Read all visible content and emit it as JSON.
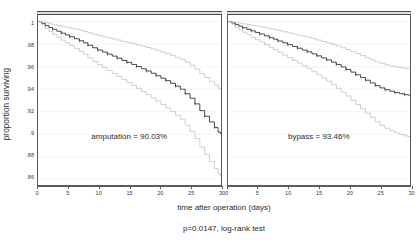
{
  "chart_data": {
    "type": "line",
    "title": "",
    "subtitle": "",
    "xlabel": "time after operation (days)",
    "ylabel": "proportion surviving",
    "footnote": "p=0.0147, log-rank test",
    "xlim": [
      0,
      30
    ],
    "ylim": [
      0.855,
      1.005
    ],
    "xticks": [
      0,
      5,
      10,
      15,
      20,
      25,
      30
    ],
    "xticklabels": [
      "0",
      "5",
      "10",
      "15",
      "20",
      "25",
      "30"
    ],
    "yticks": [
      1,
      0.98,
      0.96,
      0.94,
      0.92,
      0.9,
      0.88,
      0.86
    ],
    "yticklabels": [
      "1",
      ".98",
      ".96",
      ".94",
      ".92",
      ".9",
      ".88",
      ".86"
    ],
    "grid": true,
    "grid_axis": "y",
    "legend": "none",
    "step_style": "post",
    "panels": [
      {
        "name": "amputation",
        "annotation": "amputation = 90.03%",
        "final_survival_percent": 90.03,
        "series": [
          {
            "name": "Kaplan-Meier estimate",
            "role": "estimate",
            "color": "#2a2a2a",
            "x": [
              0,
              0.6,
              1.2,
              1.8,
              2.4,
              3.1,
              3.8,
              4.5,
              5.2,
              6.0,
              6.8,
              7.5,
              8.2,
              9.0,
              9.8,
              10.6,
              11.4,
              12.2,
              13.0,
              13.8,
              14.6,
              15.4,
              16.2,
              17.0,
              17.8,
              18.6,
              19.4,
              20.2,
              21.0,
              21.8,
              22.6,
              23.4,
              24.2,
              25.0,
              25.8,
              26.6,
              27.4,
              28.2,
              29.0,
              29.6,
              30
            ],
            "y": [
              1.0,
              0.9985,
              0.9965,
              0.9948,
              0.9932,
              0.9915,
              0.9898,
              0.9882,
              0.9866,
              0.9848,
              0.983,
              0.9812,
              0.979,
              0.9768,
              0.9748,
              0.973,
              0.9712,
              0.9694,
              0.9676,
              0.9656,
              0.9638,
              0.962,
              0.9602,
              0.9582,
              0.9562,
              0.9542,
              0.952,
              0.9498,
              0.9476,
              0.9452,
              0.9428,
              0.94,
              0.936,
              0.932,
              0.927,
              0.921,
              0.916,
              0.911,
              0.906,
              0.902,
              0.9003
            ]
          },
          {
            "name": "95% CI upper",
            "role": "ci_upper",
            "color": "#b6b6b6",
            "x": [
              0,
              0.6,
              1.2,
              1.8,
              2.4,
              3.1,
              3.8,
              4.5,
              5.2,
              6.0,
              6.8,
              7.5,
              8.2,
              9.0,
              9.8,
              10.6,
              11.4,
              12.2,
              13.0,
              13.8,
              14.6,
              15.4,
              16.2,
              17.0,
              17.8,
              18.6,
              19.4,
              20.2,
              21.0,
              21.8,
              22.6,
              23.4,
              24.2,
              25.0,
              25.8,
              26.6,
              27.4,
              28.2,
              29.0,
              29.6,
              30
            ],
            "y": [
              1.0,
              0.9996,
              0.999,
              0.9982,
              0.9974,
              0.9966,
              0.9958,
              0.995,
              0.9942,
              0.9932,
              0.9922,
              0.9912,
              0.99,
              0.9888,
              0.9876,
              0.9866,
              0.9856,
              0.9846,
              0.9836,
              0.9824,
              0.9814,
              0.9804,
              0.9794,
              0.9782,
              0.977,
              0.9758,
              0.9744,
              0.973,
              0.9716,
              0.97,
              0.9684,
              0.9666,
              0.964,
              0.9612,
              0.9578,
              0.9538,
              0.9504,
              0.947,
              0.9436,
              0.9408,
              0.9396
            ]
          },
          {
            "name": "95% CI lower",
            "role": "ci_lower",
            "color": "#b6b6b6",
            "x": [
              0,
              0.6,
              1.2,
              1.8,
              2.4,
              3.1,
              3.8,
              4.5,
              5.2,
              6.0,
              6.8,
              7.5,
              8.2,
              9.0,
              9.8,
              10.6,
              11.4,
              12.2,
              13.0,
              13.8,
              14.6,
              15.4,
              16.2,
              17.0,
              17.8,
              18.6,
              19.4,
              20.2,
              21.0,
              21.8,
              22.6,
              23.4,
              24.2,
              25.0,
              25.8,
              26.6,
              27.4,
              28.2,
              29.0,
              29.6,
              30
            ],
            "y": [
              1.0,
              0.997,
              0.9938,
              0.9912,
              0.9888,
              0.9862,
              0.9836,
              0.9812,
              0.9788,
              0.9762,
              0.9736,
              0.971,
              0.9678,
              0.9646,
              0.9618,
              0.9592,
              0.9566,
              0.954,
              0.9514,
              0.9486,
              0.946,
              0.9434,
              0.9408,
              0.938,
              0.9352,
              0.9324,
              0.9294,
              0.9264,
              0.9234,
              0.9202,
              0.917,
              0.9134,
              0.908,
              0.9026,
              0.8962,
              0.8886,
              0.8822,
              0.8758,
              0.8696,
              0.8648,
              0.8626
            ]
          }
        ]
      },
      {
        "name": "bypass",
        "annotation": "bypass = 93.46%",
        "final_survival_percent": 93.46,
        "series": [
          {
            "name": "Kaplan-Meier estimate",
            "role": "estimate",
            "color": "#2a2a2a",
            "x": [
              0,
              0.6,
              1.2,
              1.8,
              2.4,
              3.1,
              3.8,
              4.5,
              5.2,
              6.0,
              6.8,
              7.5,
              8.2,
              9.0,
              9.8,
              10.6,
              11.4,
              12.2,
              13.0,
              13.8,
              14.6,
              15.4,
              16.2,
              17.0,
              17.8,
              18.6,
              19.4,
              20.2,
              21.0,
              21.8,
              22.6,
              23.4,
              24.2,
              25.0,
              25.8,
              26.6,
              27.4,
              28.2,
              29.0,
              29.6,
              30
            ],
            "y": [
              1.0,
              0.9988,
              0.9974,
              0.996,
              0.9946,
              0.9932,
              0.9918,
              0.9904,
              0.989,
              0.9874,
              0.9858,
              0.9844,
              0.9828,
              0.9812,
              0.9796,
              0.978,
              0.9764,
              0.9748,
              0.9732,
              0.9714,
              0.9696,
              0.9678,
              0.966,
              0.964,
              0.962,
              0.9598,
              0.9576,
              0.9552,
              0.9528,
              0.9504,
              0.948,
              0.9456,
              0.9432,
              0.9412,
              0.9396,
              0.9382,
              0.937,
              0.936,
              0.9352,
              0.9348,
              0.9346
            ]
          },
          {
            "name": "95% CI upper",
            "role": "ci_upper",
            "color": "#b6b6b6",
            "x": [
              0,
              0.6,
              1.2,
              1.8,
              2.4,
              3.1,
              3.8,
              4.5,
              5.2,
              6.0,
              6.8,
              7.5,
              8.2,
              9.0,
              9.8,
              10.6,
              11.4,
              12.2,
              13.0,
              13.8,
              14.6,
              15.4,
              16.2,
              17.0,
              17.8,
              18.6,
              19.4,
              20.2,
              21.0,
              21.8,
              22.6,
              23.4,
              24.2,
              25.0,
              25.8,
              26.6,
              27.4,
              28.2,
              29.0,
              29.6,
              30
            ],
            "y": [
              1.0,
              0.9997,
              0.9992,
              0.9986,
              0.998,
              0.9974,
              0.9968,
              0.9962,
              0.9954,
              0.9946,
              0.9938,
              0.993,
              0.992,
              0.991,
              0.99,
              0.989,
              0.988,
              0.987,
              0.986,
              0.9848,
              0.9836,
              0.9824,
              0.9812,
              0.9798,
              0.9784,
              0.9768,
              0.9752,
              0.9734,
              0.9716,
              0.9698,
              0.968,
              0.9662,
              0.9644,
              0.9629,
              0.9617,
              0.9607,
              0.9598,
              0.9591,
              0.9585,
              0.9582,
              0.958
            ]
          },
          {
            "name": "95% CI lower",
            "role": "ci_lower",
            "color": "#b6b6b6",
            "x": [
              0,
              0.6,
              1.2,
              1.8,
              2.4,
              3.1,
              3.8,
              4.5,
              5.2,
              6.0,
              6.8,
              7.5,
              8.2,
              9.0,
              9.8,
              10.6,
              11.4,
              12.2,
              13.0,
              13.8,
              14.6,
              15.4,
              16.2,
              17.0,
              17.8,
              18.6,
              19.4,
              20.2,
              21.0,
              21.8,
              22.6,
              23.4,
              24.2,
              25.0,
              25.8,
              26.6,
              27.4,
              28.2,
              29.0,
              29.6,
              30
            ],
            "y": [
              1.0,
              0.9976,
              0.995,
              0.9928,
              0.9906,
              0.9884,
              0.9862,
              0.984,
              0.982,
              0.9796,
              0.9772,
              0.9752,
              0.9728,
              0.9704,
              0.968,
              0.9656,
              0.9632,
              0.9608,
              0.9584,
              0.9556,
              0.9528,
              0.95,
              0.9472,
              0.944,
              0.9408,
              0.9374,
              0.934,
              0.9302,
              0.9264,
              0.9226,
              0.9188,
              0.915,
              0.9112,
              0.908,
              0.9054,
              0.9032,
              0.9014,
              0.8998,
              0.8986,
              0.898,
              0.8976
            ]
          }
        ]
      }
    ]
  }
}
